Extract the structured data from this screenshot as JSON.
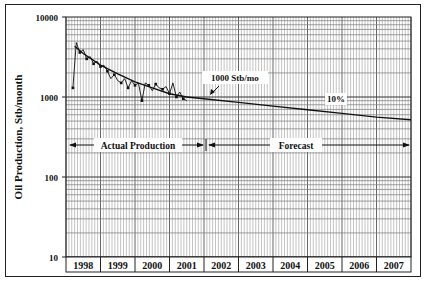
{
  "chart_data": {
    "type": "line",
    "title": "",
    "xlabel": "",
    "ylabel": "Oil Production, Stb/month",
    "yscale": "log",
    "ylim": [
      10,
      10000
    ],
    "yticks": [
      "10",
      "100",
      "1000",
      "10000"
    ],
    "xlim": [
      1998,
      2008
    ],
    "xticks": [
      "1998",
      "1999",
      "2000",
      "2001",
      "2002",
      "2003",
      "2004",
      "2005",
      "2006",
      "2007"
    ],
    "grid": {
      "vertical": "monthly",
      "horizontal": "log-minor"
    },
    "series": [
      {
        "name": "Actual Production",
        "style": "line-with-markers",
        "x": [
          1998.2,
          1998.3,
          1998.4,
          1998.5,
          1998.6,
          1998.7,
          1998.8,
          1998.9,
          1999.0,
          1999.1,
          1999.2,
          1999.3,
          1999.4,
          1999.5,
          1999.6,
          1999.7,
          1999.8,
          1999.9,
          2000.0,
          2000.1,
          2000.2,
          2000.3,
          2000.4,
          2000.5,
          2000.6,
          2000.7,
          2000.8,
          2000.9,
          2001.0,
          2001.1,
          2001.2,
          2001.3,
          2001.4,
          2001.5
        ],
        "values": [
          1300,
          4800,
          3600,
          3900,
          3000,
          3200,
          2600,
          2800,
          2400,
          2500,
          2100,
          1700,
          1900,
          1600,
          1500,
          1700,
          1300,
          1600,
          1400,
          1500,
          900,
          1500,
          1400,
          1200,
          1450,
          1300,
          1250,
          1350,
          1100,
          1500,
          1000,
          1150,
          950,
          900
        ]
      },
      {
        "name": "Hyperbolic Fit",
        "style": "line",
        "x": [
          1998.25,
          1998.5,
          1999.0,
          1999.5,
          2000.0,
          2000.5,
          2001.0,
          2001.5
        ],
        "values": [
          4300,
          3500,
          2500,
          1950,
          1550,
          1300,
          1100,
          1000
        ]
      },
      {
        "name": "Forecast",
        "style": "line",
        "x": [
          2001.5,
          2002,
          2003,
          2004,
          2005,
          2006,
          2007,
          2008
        ],
        "values": [
          1000,
          950,
          855,
          770,
          693,
          623,
          561,
          520
        ]
      }
    ],
    "annotations": [
      {
        "text": "1000 Stb/mo",
        "x": 2002.3,
        "y": 1000,
        "arrow": true
      },
      {
        "text": "10%",
        "x": 2005.0,
        "y": 800
      },
      {
        "text": "Actual Production",
        "range": [
          1998,
          2002
        ],
        "y": 250,
        "arrows": "both"
      },
      {
        "text": "Forecast",
        "range": [
          2002,
          2008
        ],
        "y": 250,
        "arrows": "both"
      }
    ]
  },
  "labels": {
    "ylabel": "Oil Production, Stb/month",
    "annot_rate": "1000 Stb/mo",
    "annot_decline": "10%",
    "annot_actual": "Actual Production",
    "annot_forecast": "Forecast"
  }
}
